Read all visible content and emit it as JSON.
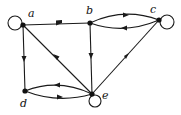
{
  "graph": {
    "type": "directed",
    "nodes": [
      {
        "id": "a",
        "label": "a",
        "x": 23,
        "y": 25,
        "lx": 28,
        "ly": 16
      },
      {
        "id": "b",
        "label": "b",
        "x": 90,
        "y": 23,
        "lx": 86,
        "ly": 13
      },
      {
        "id": "c",
        "label": "c",
        "x": 159,
        "y": 20,
        "lx": 150,
        "ly": 12
      },
      {
        "id": "d",
        "label": "d",
        "x": 25,
        "y": 91,
        "lx": 20,
        "ly": 105
      },
      {
        "id": "e",
        "label": "e",
        "x": 92,
        "y": 94,
        "lx": 102,
        "ly": 98
      }
    ],
    "edges": [
      {
        "from": "a",
        "to": "a",
        "kind": "loop"
      },
      {
        "from": "a",
        "to": "b"
      },
      {
        "from": "a",
        "to": "d"
      },
      {
        "from": "a",
        "to": "e"
      },
      {
        "from": "b",
        "to": "c",
        "kind": "arc-upper"
      },
      {
        "from": "c",
        "to": "b",
        "kind": "arc-lower"
      },
      {
        "from": "b",
        "to": "e"
      },
      {
        "from": "c",
        "to": "c",
        "kind": "loop"
      },
      {
        "from": "c",
        "to": "e"
      },
      {
        "from": "e",
        "to": "d",
        "kind": "arc-upper"
      },
      {
        "from": "d",
        "to": "e",
        "kind": "arc-lower"
      },
      {
        "from": "e",
        "to": "e",
        "kind": "loop"
      }
    ]
  },
  "labels": {
    "a": "a",
    "b": "b",
    "c": "c",
    "d": "d",
    "e": "e"
  }
}
